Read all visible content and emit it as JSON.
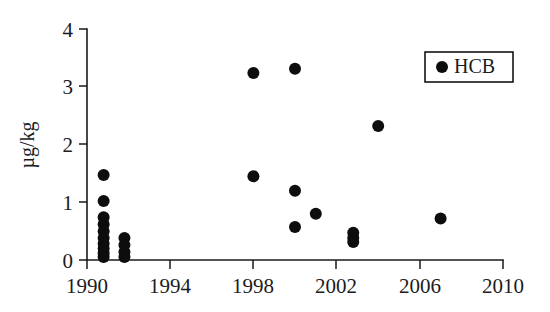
{
  "chart_data": {
    "type": "scatter",
    "title": "",
    "xlabel": "",
    "ylabel": "µg/kg",
    "xlim": [
      1990,
      2010
    ],
    "ylim": [
      0,
      4
    ],
    "xticks": [
      1990,
      1994,
      1998,
      2002,
      2006,
      2010
    ],
    "xtick_labels": [
      "1990",
      "1994",
      "1998",
      "2002",
      "2006",
      "2010"
    ],
    "yticks": [
      0,
      1,
      2,
      3,
      4
    ],
    "ytick_labels": [
      "0",
      "1",
      "2",
      "3",
      "4"
    ],
    "grid": false,
    "legend_position": "top-right",
    "marker": "filled-circle",
    "marker_color": "#0d0d0d",
    "series": [
      {
        "name": "HCB",
        "color": "#0d0d0d",
        "points": [
          {
            "x": 1990.8,
            "y": 1.47
          },
          {
            "x": 1990.8,
            "y": 1.02
          },
          {
            "x": 1990.8,
            "y": 0.74
          },
          {
            "x": 1990.8,
            "y": 0.62
          },
          {
            "x": 1990.8,
            "y": 0.5
          },
          {
            "x": 1990.8,
            "y": 0.38
          },
          {
            "x": 1990.8,
            "y": 0.28
          },
          {
            "x": 1990.8,
            "y": 0.2
          },
          {
            "x": 1990.8,
            "y": 0.12
          },
          {
            "x": 1990.8,
            "y": 0.05
          },
          {
            "x": 1991.8,
            "y": 0.38
          },
          {
            "x": 1991.8,
            "y": 0.26
          },
          {
            "x": 1991.8,
            "y": 0.14
          },
          {
            "x": 1991.8,
            "y": 0.05
          },
          {
            "x": 1998.0,
            "y": 3.24
          },
          {
            "x": 1998.0,
            "y": 1.45
          },
          {
            "x": 2000.0,
            "y": 3.31
          },
          {
            "x": 2000.0,
            "y": 1.2
          },
          {
            "x": 2000.0,
            "y": 0.57
          },
          {
            "x": 2001.0,
            "y": 0.8
          },
          {
            "x": 2002.8,
            "y": 0.47
          },
          {
            "x": 2002.8,
            "y": 0.38
          },
          {
            "x": 2002.8,
            "y": 0.31
          },
          {
            "x": 2004.0,
            "y": 2.32
          },
          {
            "x": 2007.0,
            "y": 0.72
          }
        ]
      }
    ]
  },
  "legend": {
    "entries": [
      {
        "label": "HCB",
        "marker": "filled-circle",
        "color": "#0d0d0d"
      }
    ]
  },
  "axes": {
    "y_title": "µg/kg",
    "x_title": ""
  }
}
